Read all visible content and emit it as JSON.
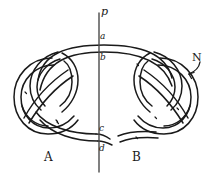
{
  "figure": {
    "kind": "knot-diagram",
    "width": 214,
    "height": 178,
    "background_color": "#ffffff",
    "ink_color": "#1a1a1a"
  },
  "labels": {
    "line_p": "p",
    "point_a": "a",
    "point_b": "b",
    "point_c": "c",
    "point_d": "d",
    "knot_left": "A",
    "knot_right": "B",
    "annotation_n": "N"
  },
  "icons": {
    "arrow": "curved-arrow-icon",
    "vertical_line": "vertical-line-p-icon"
  }
}
